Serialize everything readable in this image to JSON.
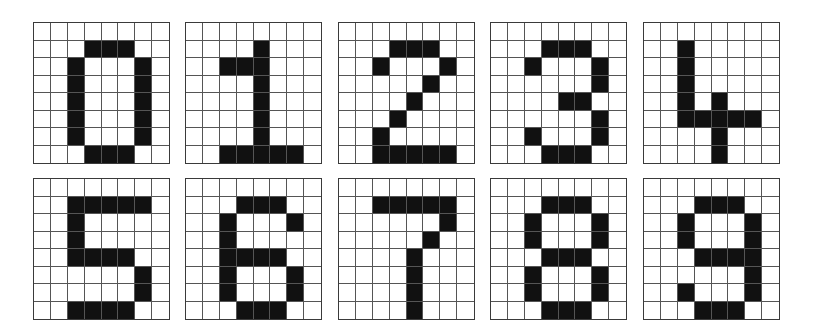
{
  "figure": {
    "grid_size": {
      "rows": 8,
      "cols": 8
    },
    "colors": {
      "on": "#111111",
      "off": "#ffffff",
      "grid_line": "#555555"
    },
    "layout": {
      "columns_x": [
        33,
        185,
        338,
        490,
        643
      ],
      "rows_y": [
        22,
        178
      ],
      "panel_width": 137,
      "panel_height": 142
    },
    "digits": [
      {
        "label": "0",
        "row": 0,
        "col": 0,
        "pixels": [
          "00000000",
          "00011100",
          "00100010",
          "00100010",
          "00100010",
          "00100010",
          "00100010",
          "00011100"
        ]
      },
      {
        "label": "1",
        "row": 0,
        "col": 1,
        "pixels": [
          "00000000",
          "00001000",
          "00111000",
          "00001000",
          "00001000",
          "00001000",
          "00001000",
          "00111110"
        ]
      },
      {
        "label": "2",
        "row": 0,
        "col": 2,
        "pixels": [
          "00000000",
          "00011100",
          "00100010",
          "00000100",
          "00001000",
          "00010000",
          "00100000",
          "00111110"
        ]
      },
      {
        "label": "3",
        "row": 0,
        "col": 3,
        "pixels": [
          "00000000",
          "00011100",
          "00100010",
          "00000010",
          "00001100",
          "00000010",
          "00100010",
          "00011100"
        ]
      },
      {
        "label": "4",
        "row": 0,
        "col": 4,
        "pixels": [
          "00000000",
          "00100000",
          "00100000",
          "00100000",
          "00101000",
          "00111110",
          "00001000",
          "00001000"
        ]
      },
      {
        "label": "5",
        "row": 1,
        "col": 0,
        "pixels": [
          "00000000",
          "00111110",
          "00100000",
          "00100000",
          "00111100",
          "00000010",
          "00000010",
          "00111100"
        ]
      },
      {
        "label": "6",
        "row": 1,
        "col": 1,
        "pixels": [
          "00000000",
          "00011100",
          "00100010",
          "00100000",
          "00111100",
          "00100010",
          "00100010",
          "00011100"
        ]
      },
      {
        "label": "7",
        "row": 1,
        "col": 2,
        "pixels": [
          "00000000",
          "00111110",
          "00000010",
          "00000100",
          "00001000",
          "00001000",
          "00001000",
          "00001000"
        ]
      },
      {
        "label": "8",
        "row": 1,
        "col": 3,
        "pixels": [
          "00000000",
          "00011100",
          "00100010",
          "00100010",
          "00011100",
          "00100010",
          "00100010",
          "00011100"
        ]
      },
      {
        "label": "9",
        "row": 1,
        "col": 4,
        "pixels": [
          "00000000",
          "00011100",
          "00100010",
          "00100010",
          "00011110",
          "00000010",
          "00100010",
          "00011100"
        ]
      }
    ]
  }
}
